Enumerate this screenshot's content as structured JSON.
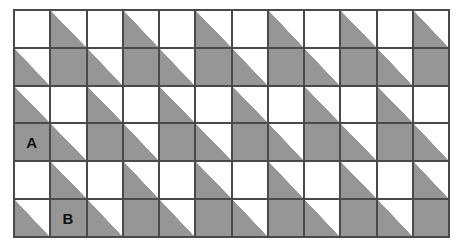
{
  "figure": {
    "title": "",
    "kind": "tessellation-grid",
    "rows": 6,
    "columns": 12,
    "colors": {
      "shaded": "#969696",
      "blank": "#ffffff",
      "gridline": "#4a4a4a",
      "label_text": "#111111"
    },
    "cell_states": {
      "blank": "blank",
      "full": "full-shaded-square",
      "tri": "lower-left-shaded-triangle"
    },
    "labels": [
      {
        "text": "A",
        "row": 4,
        "col": 1
      },
      {
        "text": "B",
        "row": 6,
        "col": 2
      }
    ],
    "grid": [
      [
        "blank",
        "tri",
        "blank",
        "tri",
        "blank",
        "tri",
        "blank",
        "tri",
        "blank",
        "tri",
        "blank",
        "tri"
      ],
      [
        "tri",
        "full",
        "tri",
        "full",
        "tri",
        "full",
        "tri",
        "full",
        "tri",
        "full",
        "tri",
        "full"
      ],
      [
        "tri",
        "blank",
        "tri",
        "blank",
        "tri",
        "blank",
        "tri",
        "blank",
        "tri",
        "blank",
        "tri",
        "blank"
      ],
      [
        "full",
        "tri",
        "full",
        "tri",
        "full",
        "tri",
        "full",
        "tri",
        "full",
        "tri",
        "full",
        "tri"
      ],
      [
        "blank",
        "tri",
        "blank",
        "tri",
        "blank",
        "tri",
        "blank",
        "tri",
        "blank",
        "tri",
        "blank",
        "tri"
      ],
      [
        "tri",
        "full",
        "tri",
        "full",
        "tri",
        "full",
        "tri",
        "full",
        "tri",
        "full",
        "tri",
        "full"
      ]
    ],
    "cell_labels": [
      [
        "",
        "",
        "",
        "",
        "",
        "",
        "",
        "",
        "",
        "",
        "",
        ""
      ],
      [
        "",
        "",
        "",
        "",
        "",
        "",
        "",
        "",
        "",
        "",
        "",
        ""
      ],
      [
        "",
        "",
        "",
        "",
        "",
        "",
        "",
        "",
        "",
        "",
        "",
        ""
      ],
      [
        "A",
        "",
        "",
        "",
        "",
        "",
        "",
        "",
        "",
        "",
        "",
        ""
      ],
      [
        "",
        "",
        "",
        "",
        "",
        "",
        "",
        "",
        "",
        "",
        "",
        ""
      ],
      [
        "",
        "B",
        "",
        "",
        "",
        "",
        "",
        "",
        "",
        "",
        "",
        ""
      ]
    ]
  }
}
